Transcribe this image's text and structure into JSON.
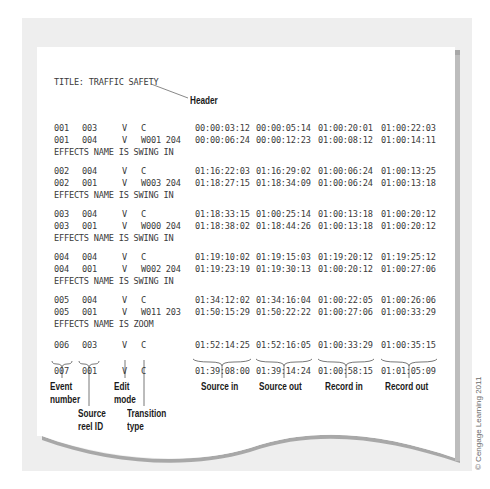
{
  "header": {
    "title_line": "TITLE: TRAFFIC SAFETY",
    "callout_label": "Header"
  },
  "edl_rows": [
    {
      "event": "001",
      "reel": "003",
      "mode": "V",
      "transition": "C",
      "source_in": "00:00:03:12",
      "source_out": "00:00:05:14",
      "record_in": "01:00:20:01",
      "record_out": "01:00:22:03"
    },
    {
      "event": "001",
      "reel": "004",
      "mode": "V",
      "transition": "W001 204",
      "source_in": "00:00:06:24",
      "source_out": "00:00:12:23",
      "record_in": "01:00:08:12",
      "record_out": "01:00:14:11"
    },
    {
      "event": "002",
      "reel": "004",
      "mode": "V",
      "transition": "C",
      "source_in": "01:16:22:03",
      "source_out": "01:16:29:02",
      "record_in": "01:00:06:24",
      "record_out": "01:00:13:25"
    },
    {
      "event": "002",
      "reel": "001",
      "mode": "V",
      "transition": "W003 204",
      "source_in": "01:18:27:15",
      "source_out": "01:18:34:09",
      "record_in": "01:00:06:24",
      "record_out": "01:00:13:18"
    },
    {
      "event": "003",
      "reel": "004",
      "mode": "V",
      "transition": "C",
      "source_in": "01:18:33:15",
      "source_out": "01:00:25:14",
      "record_in": "01:00:13:18",
      "record_out": "01:00:20:12"
    },
    {
      "event": "003",
      "reel": "001",
      "mode": "V",
      "transition": "W000 204",
      "source_in": "01:18:38:02",
      "source_out": "01:18:44:26",
      "record_in": "01:00:13:18",
      "record_out": "01:00:20:12"
    },
    {
      "event": "004",
      "reel": "004",
      "mode": "V",
      "transition": "C",
      "source_in": "01:19:10:02",
      "source_out": "01:19:15:03",
      "record_in": "01:19:20:12",
      "record_out": "01:19:25:12"
    },
    {
      "event": "004",
      "reel": "001",
      "mode": "V",
      "transition": "W002 204",
      "source_in": "01:19:23:19",
      "source_out": "01:19:30:13",
      "record_in": "01:00:20:12",
      "record_out": "01:00:27:06"
    },
    {
      "event": "005",
      "reel": "004",
      "mode": "V",
      "transition": "C",
      "source_in": "01:34:12:02",
      "source_out": "01:34:16:04",
      "record_in": "01:00:22:05",
      "record_out": "01:00:26:06"
    },
    {
      "event": "005",
      "reel": "001",
      "mode": "V",
      "transition": "W011 203",
      "source_in": "01:50:15:29",
      "source_out": "01:50:22:22",
      "record_in": "01:00:27:06",
      "record_out": "01:00:33:29"
    },
    {
      "event": "006",
      "reel": "003",
      "mode": "V",
      "transition": "C",
      "source_in": "01:52:14:25",
      "source_out": "01:52:16:05",
      "record_in": "01:00:33:29",
      "record_out": "01:00:35:15"
    },
    {
      "event": "007",
      "reel": "001",
      "mode": "V",
      "transition": "C",
      "source_in": "01:39:08:00",
      "source_out": "01:39:14:24",
      "record_in": "01:00:58:15",
      "record_out": "01:01:05:09"
    }
  ],
  "effects_notes": [
    "EFFECTS NAME IS SWING IN",
    "EFFECTS NAME IS SWING IN",
    "EFFECTS NAME IS SWING IN",
    "EFFECTS NAME IS SWING IN",
    "EFFECTS NAME IS ZOOM"
  ],
  "column_labels": {
    "event_number": "Event\nnumber",
    "source_reel_id": "Source\nreel ID",
    "edit_mode": "Edit\nmode",
    "transition_type": "Transition\ntype",
    "source_in": "Source in",
    "source_out": "Source out",
    "record_in": "Record in",
    "record_out": "Record out"
  },
  "copyright": "© Cengage Learning 2011"
}
